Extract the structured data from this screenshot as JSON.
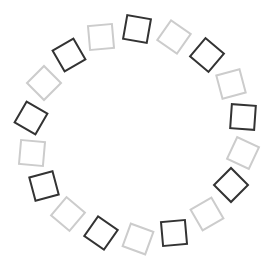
{
  "figure": {
    "colors": {
      "dark": "#333333",
      "light": "#cccccc",
      "background": "#ffffff"
    },
    "square_size": 26,
    "stroke_width": 2,
    "squares": [
      {
        "x": 137,
        "y": 29,
        "rot": 10,
        "tone": "dark"
      },
      {
        "x": 174,
        "y": 37,
        "rot": 35,
        "tone": "light"
      },
      {
        "x": 207,
        "y": 55,
        "rot": 40,
        "tone": "dark"
      },
      {
        "x": 231,
        "y": 84,
        "rot": -15,
        "tone": "light"
      },
      {
        "x": 243,
        "y": 117,
        "rot": 4,
        "tone": "dark"
      },
      {
        "x": 243,
        "y": 153,
        "rot": 25,
        "tone": "light"
      },
      {
        "x": 231,
        "y": 185,
        "rot": 45,
        "tone": "dark"
      },
      {
        "x": 207,
        "y": 214,
        "rot": -30,
        "tone": "light"
      },
      {
        "x": 174,
        "y": 233,
        "rot": -5,
        "tone": "dark"
      },
      {
        "x": 138,
        "y": 239,
        "rot": 20,
        "tone": "light"
      },
      {
        "x": 101,
        "y": 233,
        "rot": 35,
        "tone": "dark"
      },
      {
        "x": 68,
        "y": 214,
        "rot": 40,
        "tone": "light"
      },
      {
        "x": 44,
        "y": 186,
        "rot": -15,
        "tone": "dark"
      },
      {
        "x": 32,
        "y": 153,
        "rot": 5,
        "tone": "light"
      },
      {
        "x": 31,
        "y": 118,
        "rot": 30,
        "tone": "dark"
      },
      {
        "x": 44,
        "y": 83,
        "rot": 45,
        "tone": "light"
      },
      {
        "x": 69,
        "y": 55,
        "rot": -30,
        "tone": "dark"
      },
      {
        "x": 101,
        "y": 37,
        "rot": -5,
        "tone": "light"
      }
    ]
  }
}
